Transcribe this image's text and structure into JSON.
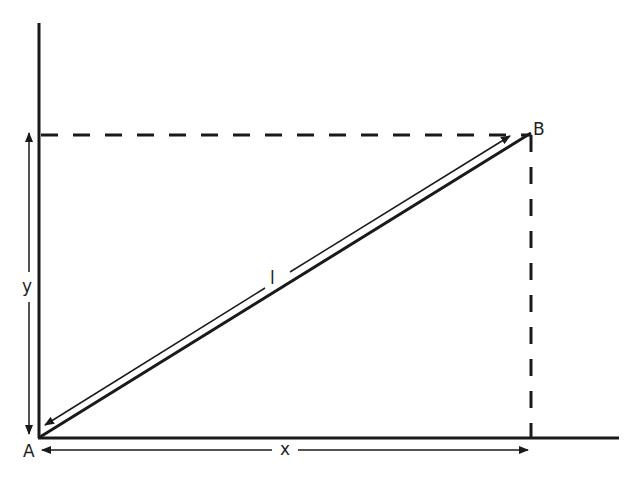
{
  "diagram": {
    "type": "right-triangle-coordinate-diagram",
    "points": {
      "A": {
        "label": "A"
      },
      "B": {
        "label": "B"
      }
    },
    "segments": {
      "hypotenuse": {
        "label": "l"
      },
      "horizontal": {
        "label": "x"
      },
      "vertical": {
        "label": "y"
      }
    },
    "colors": {
      "line": "#1a1a1a",
      "background": "#ffffff"
    }
  }
}
